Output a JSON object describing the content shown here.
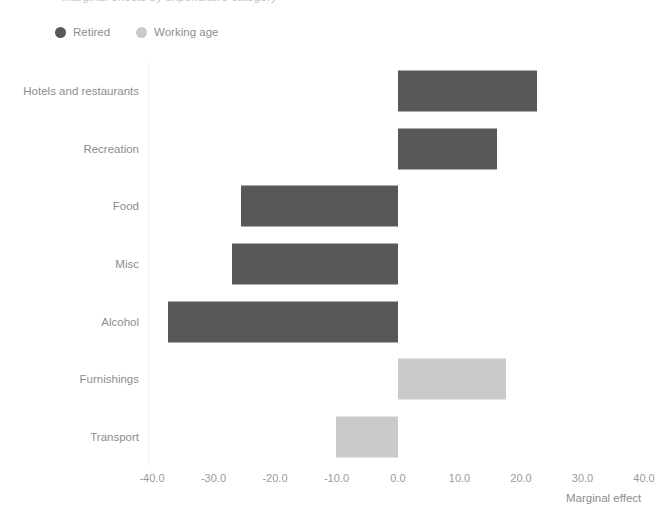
{
  "title": {
    "text": "Marginal effects by expenditure category"
  },
  "legend": {
    "position": "top-left",
    "items": [
      {
        "label": "Retired",
        "color": "#58585a",
        "icon": "circle-dot-icon"
      },
      {
        "label": "Working age",
        "color": "#c9cbca",
        "icon": "circle-dot-icon"
      }
    ]
  },
  "axis": {
    "x_label": "Marginal effect",
    "x_ticks": [
      "-40.0",
      "-30.0",
      "-20.0",
      "-10.0",
      "0.0",
      "10.0",
      "20.0",
      "30.0",
      "40.0"
    ],
    "x_min": -40,
    "x_max": 40,
    "x_step": 10
  },
  "chart_data": {
    "type": "bar",
    "orientation": "horizontal",
    "title": "Marginal effects by expenditure category",
    "xlabel": "Marginal effect",
    "ylabel": "",
    "xlim": [
      -40.0,
      40.0
    ],
    "xticks": [
      -40.0,
      -30.0,
      -20.0,
      -10.0,
      0.0,
      10.0,
      20.0,
      30.0,
      40.0
    ],
    "grid": false,
    "legend_position": "top-left",
    "categories": [
      "Hotels and restaurants",
      "Recreation",
      "Food",
      "Misc",
      "Alcohol",
      "Furnishings",
      "Transport"
    ],
    "values": [
      22.6,
      16.1,
      -25.5,
      -27.0,
      -37.4,
      17.6,
      -10.1
    ],
    "group_by_bar": [
      "Retired",
      "Retired",
      "Retired",
      "Retired",
      "Retired",
      "Working age",
      "Working age"
    ],
    "series": [
      {
        "name": "Retired",
        "color": "#58585a",
        "points": [
          {
            "category": "Hotels and restaurants",
            "value": 22.6
          },
          {
            "category": "Recreation",
            "value": 16.1
          },
          {
            "category": "Food",
            "value": -25.5
          },
          {
            "category": "Misc",
            "value": -27.0
          },
          {
            "category": "Alcohol",
            "value": -37.4
          }
        ]
      },
      {
        "name": "Working age",
        "color": "#c9cbca",
        "points": [
          {
            "category": "Furnishings",
            "value": 17.6
          },
          {
            "category": "Transport",
            "value": -10.1
          }
        ]
      }
    ]
  },
  "rows": [
    {
      "label": "Hotels and restaurants",
      "value": 22.6,
      "series": "Retired"
    },
    {
      "label": "Recreation",
      "value": 16.1,
      "series": "Retired"
    },
    {
      "label": "Food",
      "value": -25.5,
      "series": "Retired"
    },
    {
      "label": "Misc",
      "value": -27.0,
      "series": "Retired"
    },
    {
      "label": "Alcohol",
      "value": -37.4,
      "series": "Retired"
    },
    {
      "label": "Furnishings",
      "value": 17.6,
      "series": "Working age"
    },
    {
      "label": "Transport",
      "value": -10.1,
      "series": "Working age"
    }
  ]
}
